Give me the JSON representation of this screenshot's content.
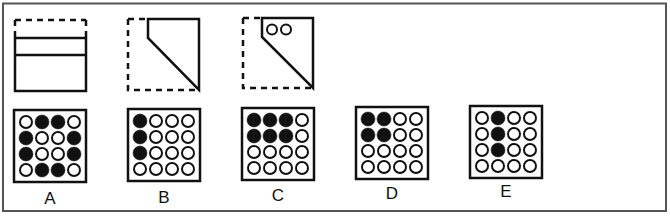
{
  "puzzle": {
    "frame": {
      "x": 3,
      "y": 3,
      "w": 663,
      "h": 208
    },
    "stem_figures": [
      {
        "name": "fold-step-1",
        "description": "square folded in half upward (dashed top half, solid bottom with fold line)"
      },
      {
        "name": "fold-step-2",
        "description": "folded diagonally leaving a corner notch"
      },
      {
        "name": "fold-step-3",
        "description": "two holes punched near the top edge",
        "holes": 2
      }
    ],
    "options": [
      {
        "label": "A",
        "grid": [
          [
            0,
            1,
            1,
            0
          ],
          [
            1,
            0,
            0,
            1
          ],
          [
            1,
            0,
            0,
            1
          ],
          [
            0,
            1,
            1,
            0
          ]
        ]
      },
      {
        "label": "B",
        "grid": [
          [
            1,
            0,
            0,
            0
          ],
          [
            1,
            0,
            0,
            0
          ],
          [
            1,
            0,
            0,
            0
          ],
          [
            0,
            0,
            0,
            0
          ]
        ]
      },
      {
        "label": "C",
        "grid": [
          [
            1,
            1,
            1,
            0
          ],
          [
            1,
            1,
            1,
            0
          ],
          [
            0,
            0,
            0,
            0
          ],
          [
            0,
            0,
            0,
            0
          ]
        ]
      },
      {
        "label": "D",
        "grid": [
          [
            1,
            1,
            0,
            0
          ],
          [
            1,
            1,
            0,
            0
          ],
          [
            0,
            0,
            0,
            0
          ],
          [
            0,
            0,
            0,
            0
          ]
        ]
      },
      {
        "label": "E",
        "grid": [
          [
            0,
            1,
            0,
            0
          ],
          [
            0,
            1,
            0,
            0
          ],
          [
            0,
            1,
            0,
            0
          ],
          [
            0,
            0,
            0,
            0
          ]
        ]
      }
    ],
    "colors": {
      "line": "#111111",
      "frame": "#555555",
      "background": "#ffffff"
    }
  }
}
